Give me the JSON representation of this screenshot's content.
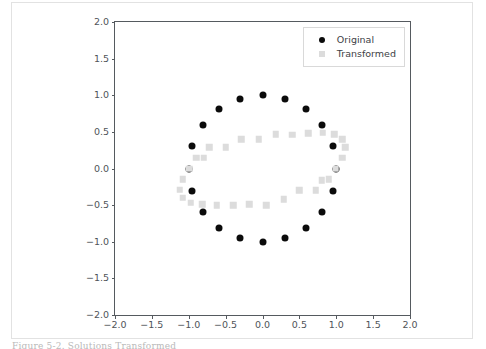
{
  "figure": {
    "caption_partial": "Figure 5-2. Solutions Transformed"
  },
  "legend": {
    "position": "upper right",
    "entries": [
      {
        "label": "Original",
        "marker": "circle",
        "color": "#0b0b0b"
      },
      {
        "label": "Transformed",
        "marker": "square",
        "color": "#dcdcdc"
      }
    ]
  },
  "chart_data": {
    "type": "scatter",
    "title": "",
    "xlabel": "",
    "ylabel": "",
    "xlim": [
      -2.0,
      2.0
    ],
    "ylim": [
      -2.0,
      2.0
    ],
    "grid": false,
    "xticks": [
      -2.0,
      -1.5,
      -1.0,
      -0.5,
      0.0,
      0.5,
      1.0,
      1.5,
      2.0
    ],
    "yticks": [
      -2.0,
      -1.5,
      -1.0,
      -0.5,
      0.0,
      0.5,
      1.0,
      1.5,
      2.0
    ],
    "xtick_labels": [
      "-2.0",
      "-1.5",
      "-1.0",
      "-0.5",
      "0.0",
      "0.5",
      "1.0",
      "1.5",
      "2.0"
    ],
    "ytick_labels": [
      "-2.0",
      "-1.5",
      "-1.0",
      "-0.5",
      "0.0",
      "0.5",
      "1.0",
      "1.5",
      "2.0"
    ],
    "series": [
      {
        "name": "Original",
        "marker": "o",
        "color": "#0b0b0b",
        "size": 7,
        "points": [
          [
            1.0,
            0.0
          ],
          [
            0.95,
            0.31
          ],
          [
            0.81,
            0.59
          ],
          [
            0.59,
            0.81
          ],
          [
            0.31,
            0.95
          ],
          [
            0.0,
            1.0
          ],
          [
            -0.31,
            0.95
          ],
          [
            -0.59,
            0.81
          ],
          [
            -0.81,
            0.59
          ],
          [
            -0.95,
            0.31
          ],
          [
            -1.0,
            0.0
          ],
          [
            -0.95,
            -0.31
          ],
          [
            -0.81,
            -0.59
          ],
          [
            -0.59,
            -0.81
          ],
          [
            -0.31,
            -0.95
          ],
          [
            0.0,
            -1.0
          ],
          [
            0.31,
            -0.95
          ],
          [
            0.59,
            -0.81
          ],
          [
            0.81,
            -0.59
          ],
          [
            0.95,
            -0.31
          ]
        ]
      },
      {
        "name": "Transformed",
        "marker": "s",
        "color": "#dcdcdc",
        "size": 6.5,
        "points": [
          [
            1.12,
            0.29
          ],
          [
            1.08,
            0.4
          ],
          [
            0.97,
            0.47
          ],
          [
            0.82,
            0.49
          ],
          [
            0.62,
            0.48
          ],
          [
            0.4,
            0.46
          ],
          [
            0.18,
            0.47
          ],
          [
            -0.05,
            0.4
          ],
          [
            -0.29,
            0.4
          ],
          [
            -0.5,
            0.29
          ],
          [
            -0.72,
            0.29
          ],
          [
            -0.8,
            0.15
          ],
          [
            -0.9,
            0.15
          ],
          [
            -0.99,
            0.0
          ],
          [
            -1.08,
            -0.15
          ],
          [
            -1.12,
            -0.29
          ],
          [
            -1.08,
            -0.4
          ],
          [
            -0.97,
            -0.47
          ],
          [
            -0.82,
            -0.49
          ],
          [
            -0.62,
            -0.5
          ],
          [
            -0.4,
            -0.5
          ],
          [
            -0.18,
            -0.49
          ],
          [
            0.05,
            -0.5
          ],
          [
            0.29,
            -0.42
          ],
          [
            0.5,
            -0.3
          ],
          [
            0.72,
            -0.3
          ],
          [
            0.8,
            -0.16
          ],
          [
            0.9,
            -0.15
          ],
          [
            0.99,
            0.0
          ],
          [
            1.08,
            0.15
          ]
        ]
      }
    ]
  }
}
